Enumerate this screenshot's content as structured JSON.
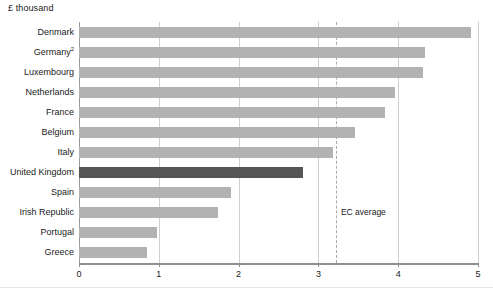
{
  "chart_data": {
    "type": "bar",
    "orientation": "horizontal",
    "title": "",
    "unit_label": "£ thousand",
    "xlabel": "",
    "ylabel": "",
    "xlim": [
      0,
      5
    ],
    "xticks": [
      "0",
      "1",
      "2",
      "3",
      "4",
      "5"
    ],
    "grid": true,
    "grid_axis": "x",
    "legend": "none",
    "categories": [
      "Denmark",
      "Germany",
      "Luxembourg",
      "Netherlands",
      "France",
      "Belgium",
      "Italy",
      "United Kingdom",
      "Spain",
      "Irish Republic",
      "Portugal",
      "Greece"
    ],
    "category_footnotes": [
      "",
      "2",
      "",
      "",
      "",
      "",
      "",
      "",
      "",
      "",
      "",
      ""
    ],
    "values": [
      4.91,
      4.33,
      4.31,
      3.96,
      3.83,
      3.46,
      3.18,
      2.81,
      1.9,
      1.74,
      0.98,
      0.85
    ],
    "highlight_category": "United Kingdom",
    "annotations": [
      {
        "name": "EC average",
        "label": "EC average",
        "value": 3.22,
        "style": "dashed-vertical"
      }
    ],
    "colors": {
      "bar": "#b2b2b2",
      "bar_highlight": "#555555",
      "gridline": "#cfcfcf",
      "axis": "#8f8f8f",
      "annotation_line": "#a9a9a9",
      "text": "#1a1a1a",
      "background": "#ffffff"
    }
  }
}
